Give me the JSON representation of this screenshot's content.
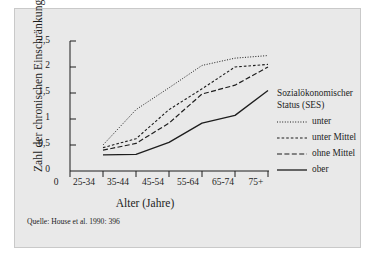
{
  "chart_data": {
    "type": "line",
    "title": "",
    "xlabel": "Alter (Jahre)",
    "ylabel": "Zahl der chronischen Einschränkungen",
    "categories": [
      "25-34",
      "35-44",
      "45-54",
      "55-64",
      "65-74",
      "75+"
    ],
    "xticklabels": [
      "0",
      "25-34",
      "35-44",
      "45-54",
      "55-64",
      "65-74",
      "75+"
    ],
    "yticklabels": [
      "0",
      "0,5",
      "1",
      "1,5",
      "2",
      "2,5"
    ],
    "yticks": [
      0,
      0.5,
      1,
      1.5,
      2,
      2.5
    ],
    "ylim": [
      0,
      2.5
    ],
    "grid": false,
    "legend_position": "right",
    "series": [
      {
        "name": "unter",
        "style": "dotted",
        "values": [
          0.5,
          1.18,
          1.6,
          2.03,
          2.17,
          2.22
        ]
      },
      {
        "name": "unter Mittel",
        "style": "dashed",
        "values": [
          0.45,
          0.62,
          1.18,
          1.58,
          2.0,
          2.05
        ]
      },
      {
        "name": "ohne Mittel",
        "style": "long-dashed",
        "values": [
          0.4,
          0.53,
          0.92,
          1.48,
          1.65,
          2.0
        ]
      },
      {
        "name": "ober",
        "style": "solid",
        "values": [
          0.31,
          0.32,
          0.55,
          0.92,
          1.07,
          1.55
        ]
      }
    ]
  },
  "legend": {
    "title_line1": "Sozialökonomischer",
    "title_line2": "Status (SES)"
  },
  "source": {
    "text": "Quelle: House et al. 1990: 396"
  },
  "colors": {
    "panel": "#e9e9e9",
    "ink": "#1d1d1d",
    "border": "#c9c9c9"
  }
}
